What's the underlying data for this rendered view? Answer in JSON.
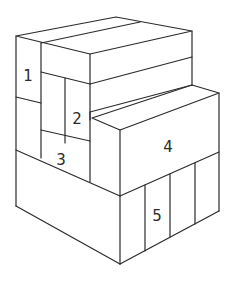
{
  "diagram": {
    "type": "isometric-block-stack",
    "stroke_color": "#2a2a2a",
    "background": "#ffffff",
    "labels": [
      {
        "id": "1",
        "text": "1",
        "x": 28,
        "y": 76
      },
      {
        "id": "2",
        "text": "2",
        "x": 77,
        "y": 119
      },
      {
        "id": "3",
        "text": "3",
        "x": 61,
        "y": 160
      },
      {
        "id": "4",
        "text": "4",
        "x": 168,
        "y": 147
      },
      {
        "id": "5",
        "text": "5",
        "x": 157,
        "y": 216
      }
    ]
  }
}
